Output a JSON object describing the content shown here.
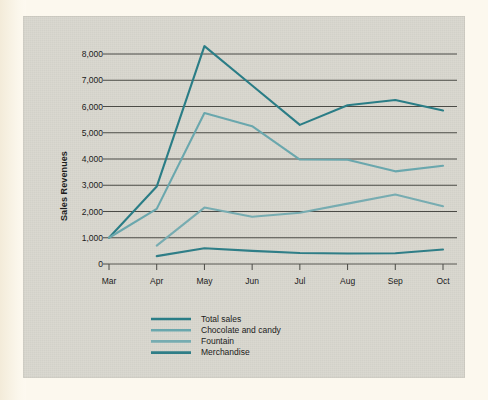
{
  "figure": {
    "panel_background": "#d8d6cd",
    "page_background": "#fcf8ee"
  },
  "chart_data": {
    "type": "line",
    "title": "",
    "xlabel": "",
    "ylabel": "Sales Revenues",
    "categories": [
      "Mar",
      "Apr",
      "May",
      "Jun",
      "Jul",
      "Aug",
      "Sep",
      "Oct"
    ],
    "ylim": [
      0,
      8000
    ],
    "yticks": [
      0,
      1000,
      2000,
      3000,
      4000,
      5000,
      6000,
      7000,
      8000
    ],
    "ytick_labels": [
      "0",
      "1,000",
      "2,000",
      "3,000",
      "4,000",
      "5,000",
      "6,000",
      "7,000",
      "8,000"
    ],
    "grid": true,
    "grid_axis": "y",
    "legend_position": "bottom-left",
    "series": [
      {
        "name": "Total sales",
        "color": "#2a7d86",
        "values": [
          1000,
          2950,
          8300,
          6800,
          5300,
          6050,
          6250,
          5850
        ]
      },
      {
        "name": "Chocolate and candy",
        "color": "#6aa7ad",
        "values": [
          1000,
          2100,
          5750,
          5250,
          3980,
          3970,
          3530,
          3740
        ]
      },
      {
        "name": "Fountain",
        "color": "#77acb1",
        "values": [
          null,
          700,
          2150,
          1800,
          1950,
          2300,
          2650,
          2200
        ]
      },
      {
        "name": "Merchandise",
        "color": "#2f7e87",
        "values": [
          null,
          300,
          600,
          500,
          420,
          400,
          410,
          550
        ]
      }
    ]
  },
  "legend": {
    "items": [
      {
        "label": "Total sales",
        "color": "#2a7d86"
      },
      {
        "label": "Chocolate and candy",
        "color": "#6aa7ad"
      },
      {
        "label": "Fountain",
        "color": "#77acb1"
      },
      {
        "label": "Merchandise",
        "color": "#2f7e87"
      }
    ]
  }
}
